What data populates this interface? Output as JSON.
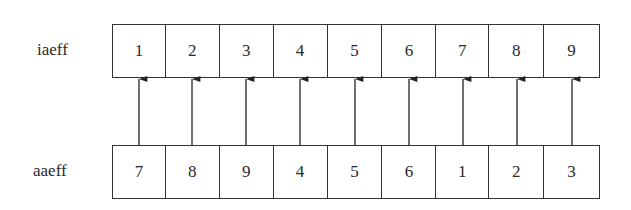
{
  "diagram": {
    "top_row": {
      "label": "iaeff",
      "cells": [
        "1",
        "2",
        "3",
        "4",
        "5",
        "6",
        "7",
        "8",
        "9"
      ]
    },
    "bottom_row": {
      "label": "aaeff",
      "cells": [
        "7",
        "8",
        "9",
        "4",
        "5",
        "6",
        "1",
        "2",
        "3"
      ]
    },
    "arrows": {
      "count": 9,
      "direction": "bottom-to-top",
      "description": "Each cell of aaeff points up to the cell of iaeff directly above it"
    }
  }
}
